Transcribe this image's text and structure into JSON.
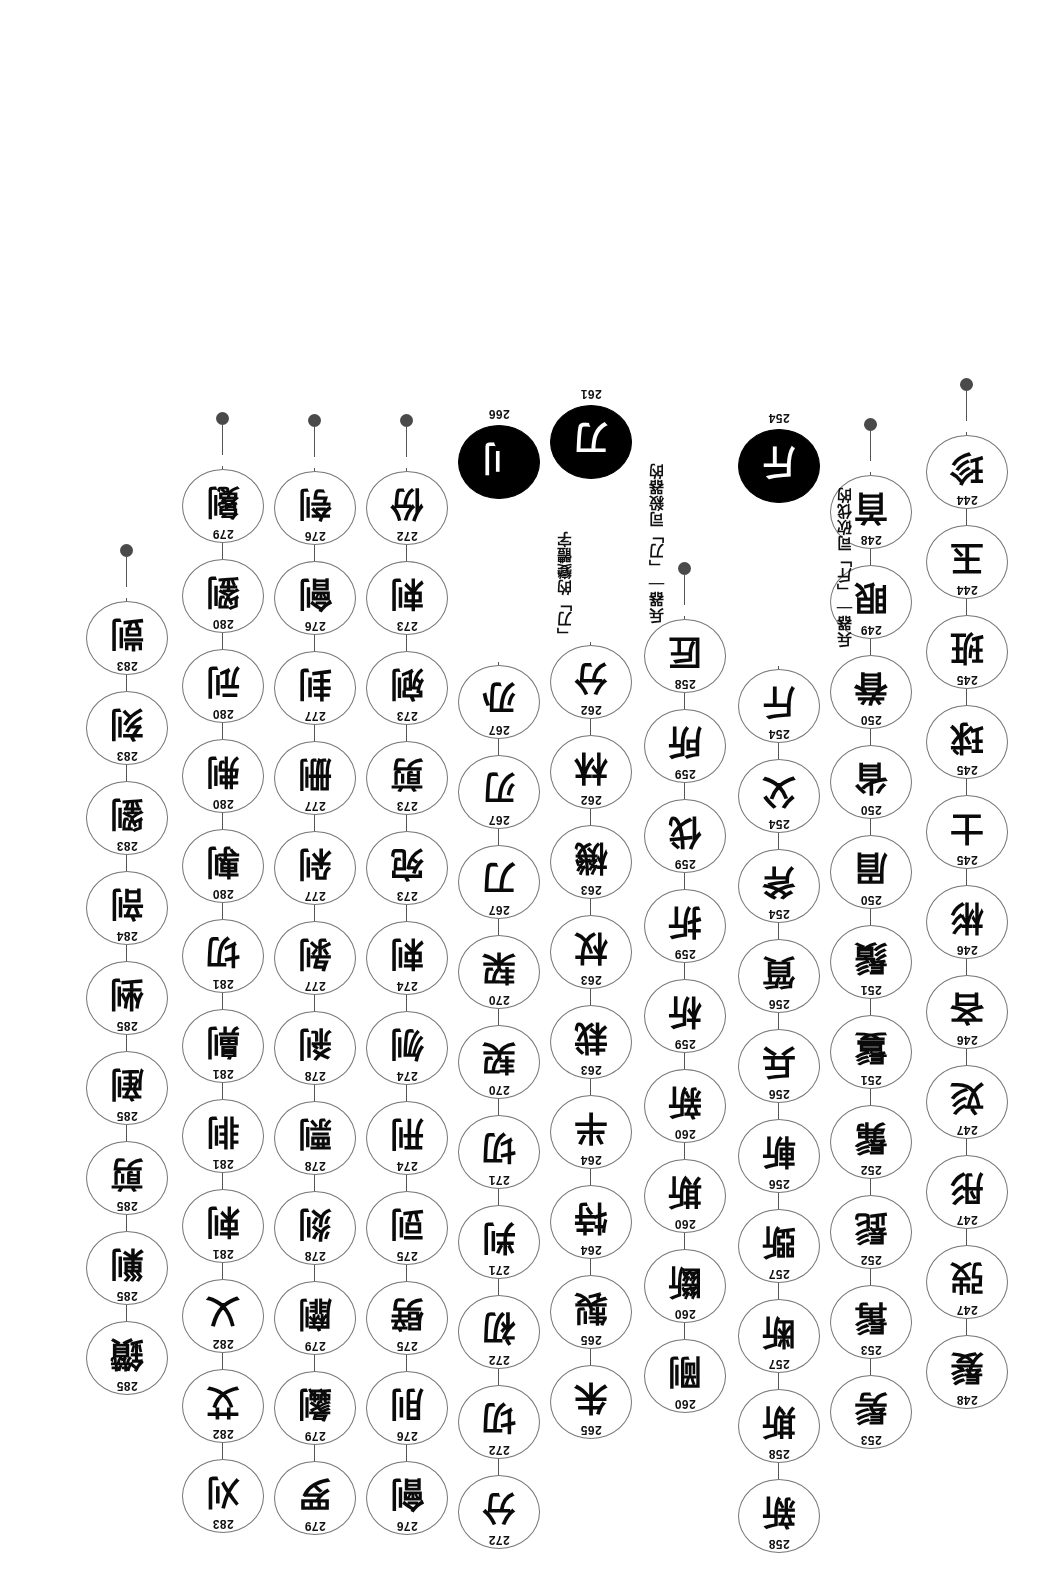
{
  "figure": {
    "type": "seal-script evolution chart",
    "node_shape": "ellipse",
    "link_color": "#555555",
    "node_border_color": "#777777",
    "filled_node_color": "#000000",
    "terminal_dot_color": "#4a4a4a",
    "page_rotation_deg": 180
  },
  "columns": [
    {
      "id": "col-1",
      "nodes": [
        {
          "num": "248",
          "glyph": "髮"
        },
        {
          "num": "247",
          "glyph": "弢"
        },
        {
          "num": "247",
          "glyph": "彤"
        },
        {
          "num": "247",
          "glyph": "彣"
        },
        {
          "num": "246",
          "glyph": "吝"
        },
        {
          "num": "246",
          "glyph": "彬"
        },
        {
          "num": "245",
          "glyph": "士"
        },
        {
          "num": "245",
          "glyph": "球"
        },
        {
          "num": "245",
          "glyph": "班"
        },
        {
          "num": "244",
          "glyph": "玉"
        },
        {
          "num": "244",
          "glyph": "珍"
        }
      ],
      "terminal": true
    },
    {
      "id": "col-2",
      "nodes": [
        {
          "num": "253",
          "glyph": "髣"
        },
        {
          "num": "253",
          "glyph": "髯"
        },
        {
          "num": "252",
          "glyph": "髭"
        },
        {
          "num": "252",
          "glyph": "髴"
        },
        {
          "num": "251",
          "glyph": "鬘"
        },
        {
          "num": "251",
          "glyph": "鬚"
        },
        {
          "num": "250",
          "glyph": "眉"
        },
        {
          "num": "250",
          "glyph": "省"
        },
        {
          "num": "250",
          "glyph": "眷"
        },
        {
          "num": "249",
          "glyph": "眼"
        },
        {
          "num": "248",
          "glyph": "首"
        }
      ],
      "terminal": true
    },
    {
      "id": "col-3",
      "nodes": [
        {
          "num": "258",
          "glyph": "新"
        },
        {
          "num": "258",
          "glyph": "斯"
        },
        {
          "num": "257",
          "glyph": "断"
        },
        {
          "num": "257",
          "glyph": "斲"
        },
        {
          "num": "256",
          "glyph": "斬"
        },
        {
          "num": "256",
          "glyph": "兵"
        },
        {
          "num": "256",
          "glyph": "質"
        },
        {
          "num": "254",
          "glyph": "斧"
        },
        {
          "num": "254",
          "glyph": "父"
        },
        {
          "num": "254",
          "glyph": "斤"
        }
      ],
      "annotation": {
        "lead": "兵器",
        "head": "「斤」",
        "note": "司砍伐的"
      },
      "seal": {
        "num": "254",
        "glyph": "斤"
      }
    },
    {
      "id": "col-4",
      "nodes": [
        {
          "num": "260",
          "glyph": "剛"
        },
        {
          "num": "260",
          "glyph": "斷"
        },
        {
          "num": "260",
          "glyph": "斯"
        },
        {
          "num": "260",
          "glyph": "新"
        },
        {
          "num": "259",
          "glyph": "析"
        },
        {
          "num": "259",
          "glyph": "折"
        },
        {
          "num": "259",
          "glyph": "伐"
        },
        {
          "num": "259",
          "glyph": "所"
        },
        {
          "num": "258",
          "glyph": "匠"
        }
      ],
      "terminal": true
    },
    {
      "id": "col-5",
      "nodes": [
        {
          "num": "265",
          "glyph": "朱"
        },
        {
          "num": "265",
          "glyph": "製"
        },
        {
          "num": "264",
          "glyph": "特"
        },
        {
          "num": "264",
          "glyph": "半"
        },
        {
          "num": "263",
          "glyph": "栽"
        },
        {
          "num": "263",
          "glyph": "杖"
        },
        {
          "num": "263",
          "glyph": "機"
        },
        {
          "num": "262",
          "glyph": "林"
        },
        {
          "num": "262",
          "glyph": "分"
        }
      ],
      "annotation": {
        "lead": "兵器",
        "head": "「刀」",
        "note": "司殺器的"
      },
      "seal": {
        "num": "261",
        "glyph": "刀"
      }
    },
    {
      "id": "col-6",
      "nodes": [
        {
          "num": "272",
          "glyph": "分"
        },
        {
          "num": "272",
          "glyph": "切"
        },
        {
          "num": "272",
          "glyph": "初"
        },
        {
          "num": "271",
          "glyph": "判"
        },
        {
          "num": "271",
          "glyph": "切"
        },
        {
          "num": "270",
          "glyph": "契"
        },
        {
          "num": "270",
          "glyph": "栔"
        },
        {
          "num": "267",
          "glyph": "刀"
        },
        {
          "num": "267",
          "glyph": "刃"
        },
        {
          "num": "267",
          "glyph": "刅"
        }
      ],
      "annotation": {
        "head": "「刀」",
        "note": "的變體字"
      },
      "seal": {
        "num": "266",
        "glyph": "刂"
      }
    },
    {
      "id": "col-7",
      "nodes": [
        {
          "num": "276",
          "glyph": "劊"
        },
        {
          "num": "276",
          "glyph": "刖"
        },
        {
          "num": "275",
          "glyph": "劈"
        },
        {
          "num": "275",
          "glyph": "剅"
        },
        {
          "num": "274",
          "glyph": "刑"
        },
        {
          "num": "274",
          "glyph": "刎"
        },
        {
          "num": "274",
          "glyph": "剌"
        },
        {
          "num": "273",
          "glyph": "宛"
        },
        {
          "num": "273",
          "glyph": "剪"
        },
        {
          "num": "273",
          "glyph": "剜"
        },
        {
          "num": "273",
          "glyph": "剌"
        },
        {
          "num": "272",
          "glyph": "份"
        }
      ],
      "terminal": true
    },
    {
      "id": "col-8",
      "nodes": [
        {
          "num": "279",
          "glyph": "罗"
        },
        {
          "num": "279",
          "glyph": "劙"
        },
        {
          "num": "279",
          "glyph": "劘"
        },
        {
          "num": "278",
          "glyph": "剡"
        },
        {
          "num": "278",
          "glyph": "剽"
        },
        {
          "num": "278",
          "glyph": "剎"
        },
        {
          "num": "277",
          "glyph": "剝"
        },
        {
          "num": "277",
          "glyph": "剁"
        },
        {
          "num": "277",
          "glyph": "删"
        },
        {
          "num": "277",
          "glyph": "刲"
        },
        {
          "num": "276",
          "glyph": "劊"
        },
        {
          "num": "276",
          "glyph": "刳"
        }
      ],
      "terminal": true
    },
    {
      "id": "col-9",
      "nodes": [
        {
          "num": "283",
          "glyph": "刈"
        },
        {
          "num": "282",
          "glyph": "艾"
        },
        {
          "num": "282",
          "glyph": "乂"
        },
        {
          "num": "281",
          "glyph": "剌"
        },
        {
          "num": "281",
          "glyph": "剕"
        },
        {
          "num": "281",
          "glyph": "劓"
        },
        {
          "num": "281",
          "glyph": "切"
        },
        {
          "num": "280",
          "glyph": "剸"
        },
        {
          "num": "280",
          "glyph": "刜"
        },
        {
          "num": "280",
          "glyph": "刓"
        },
        {
          "num": "280",
          "glyph": "劉"
        },
        {
          "num": "279",
          "glyph": "劖"
        }
      ],
      "terminal": true
    },
    {
      "id": "col-10",
      "nodes": [
        {
          "num": "285",
          "glyph": "鑽"
        },
        {
          "num": "285",
          "glyph": "剿"
        },
        {
          "num": "285",
          "glyph": "剪"
        },
        {
          "num": "285",
          "glyph": "剷"
        },
        {
          "num": "285",
          "glyph": "剉"
        },
        {
          "num": "284",
          "glyph": "剖"
        },
        {
          "num": "283",
          "glyph": "劉"
        },
        {
          "num": "283",
          "glyph": "刻"
        },
        {
          "num": "283",
          "glyph": "剴"
        }
      ],
      "terminal": true
    }
  ]
}
